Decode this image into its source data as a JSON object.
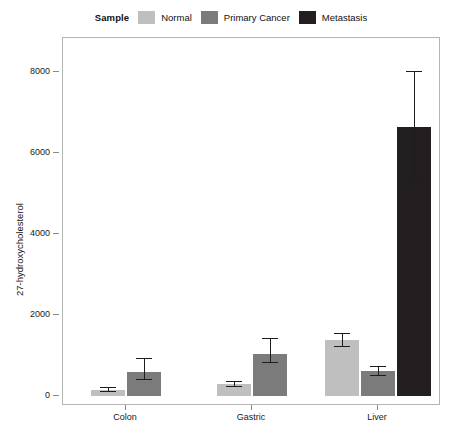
{
  "legend": {
    "title": "Sample",
    "entries": [
      {
        "label": "Normal",
        "color": "#bfbfbf"
      },
      {
        "label": "Primary Cancer",
        "color": "#7b7b7b"
      },
      {
        "label": "Metastasis",
        "color": "#231f20"
      }
    ]
  },
  "axes": {
    "ylabel": "27-hydroxycholesterol",
    "yticks": [
      "0",
      "2000",
      "4000",
      "6000",
      "8000"
    ],
    "ytick_values": [
      0,
      2000,
      4000,
      6000,
      8000
    ],
    "ylim": [
      -250,
      8850
    ],
    "xticks": [
      "Colon",
      "Gastric",
      "Liver"
    ]
  },
  "chart_data": {
    "type": "bar",
    "title": "",
    "xlabel": "",
    "ylabel": "27-hydroxycholesterol",
    "categories": [
      "Colon",
      "Gastric",
      "Liver"
    ],
    "legend_title": "Sample",
    "legend_position": "top-center",
    "grid": false,
    "ylim": [
      -250,
      8850
    ],
    "yticks": [
      0,
      2000,
      4000,
      6000,
      8000
    ],
    "error_bars": "present",
    "series": [
      {
        "name": "Normal",
        "color": "#bfbfbf",
        "values": [
          150,
          300,
          1380
        ],
        "err_low": [
          60,
          70,
          170
        ],
        "err_high": [
          60,
          70,
          170
        ]
      },
      {
        "name": "Primary Cancer",
        "color": "#7b7b7b",
        "values": [
          600,
          1030,
          620
        ],
        "err_low": [
          210,
          210,
          130
        ],
        "err_high": [
          330,
          390,
          130
        ]
      },
      {
        "name": "Metastasis",
        "color": "#231f20",
        "values": [
          null,
          null,
          6650
        ],
        "err_low": [
          null,
          null,
          1380
        ],
        "err_high": [
          null,
          null,
          1380
        ]
      }
    ]
  }
}
